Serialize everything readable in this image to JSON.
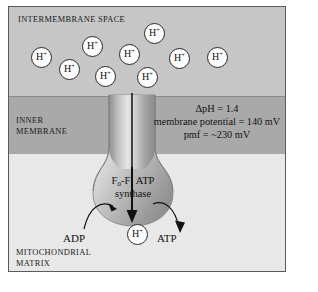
{
  "figure": {
    "regions": {
      "intermembrane_space_label": "INTERMEMBRANE SPACE",
      "inner_membrane_label": "INNER\nMEMBRANE",
      "mitochondrial_matrix_label": "MITOCHONDRIAL\nMATRIX"
    },
    "colors": {
      "intermembrane_space_fill": "#c6c6c6",
      "inner_membrane_fill": "#a9a9a9",
      "matrix_fill": "#e8e8e8",
      "border": "#5a5a5a",
      "proton_fill": "#fdfdfd",
      "proton_stroke": "#2a2a2a",
      "arrow": "#111111"
    },
    "protons": {
      "ion_label": "H",
      "ion_charge": "+",
      "intermembrane_count": 9,
      "matrix_count": 1,
      "intermembrane_positions": [
        {
          "x": 22,
          "y": 40
        },
        {
          "x": 50,
          "y": 52
        },
        {
          "x": 73,
          "y": 29
        },
        {
          "x": 86,
          "y": 59
        },
        {
          "x": 110,
          "y": 37
        },
        {
          "x": 128,
          "y": 60
        },
        {
          "x": 135,
          "y": 16
        },
        {
          "x": 160,
          "y": 41
        },
        {
          "x": 198,
          "y": 40
        }
      ],
      "matrix_positions": [
        {
          "x": 118,
          "y": 217
        }
      ]
    },
    "synthase": {
      "name_line1": "F",
      "name_sub1": "0",
      "name_mid": "-F",
      "name_sub2": "1",
      "name_end": " ATP",
      "name_line2": "synthase",
      "full_name": "F0-F1 ATP synthase"
    },
    "annotation": {
      "line1": "ΔpH = 1.4",
      "line2": "membrane potential = 140 mV",
      "line3": "pmf = ~230 mV"
    },
    "substrates": {
      "adp_label": "ADP",
      "atp_label": "ATP"
    }
  }
}
